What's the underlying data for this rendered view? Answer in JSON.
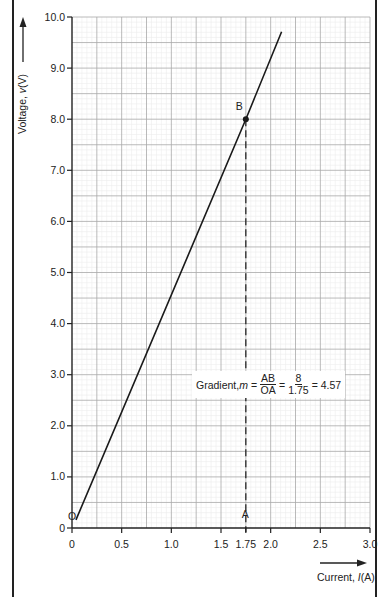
{
  "chart_data": {
    "type": "line",
    "title": "",
    "xlabel": "Current, I(A)",
    "ylabel": "Voltage, v(V)",
    "xlim": [
      0,
      3.0
    ],
    "ylim": [
      0,
      10.0
    ],
    "grid": true,
    "x_ticks": [
      "0",
      "0.5",
      "1.0",
      "1.5",
      "1.75",
      "2.0",
      "2.5",
      "3.0"
    ],
    "x_tick_values": [
      0,
      0.5,
      1.0,
      1.5,
      1.75,
      2.0,
      2.5,
      3.0
    ],
    "y_ticks": [
      "0",
      "1.0",
      "2.0",
      "3.0",
      "4.0",
      "5.0",
      "6.0",
      "7.0",
      "8.0",
      "9.0",
      "10.0"
    ],
    "y_tick_values": [
      0,
      1,
      2,
      3,
      4,
      5,
      6,
      7,
      8,
      9,
      10
    ],
    "series": [
      {
        "name": "V-I line",
        "x": [
          0.04,
          1.75,
          2.11
        ],
        "y": [
          0.16,
          8.0,
          9.71
        ]
      }
    ],
    "points": [
      {
        "label": "O",
        "x": 0,
        "y": 0
      },
      {
        "label": "A",
        "x": 1.75,
        "y": 0
      },
      {
        "label": "B",
        "x": 1.75,
        "y": 8.0
      }
    ],
    "annotations": [
      {
        "text": "Gradient, m = AB/OA = 8/1.75 = 4.57",
        "prefix": "Gradient, ",
        "var": "m",
        "eq1": "=",
        "frac1_num": "AB",
        "frac1_den": "OA",
        "eq2": "=",
        "frac2_num": "8",
        "frac2_den": "1.75",
        "result": "= 4.57"
      }
    ],
    "legend": null
  },
  "labels": {
    "ylabel_text": "Voltage, ",
    "ylabel_var": "v",
    "ylabel_unit": "(V)",
    "xlabel_text": "Current, ",
    "xlabel_var": "I",
    "xlabel_unit": "(A)",
    "point_O": "O",
    "point_A": "A",
    "point_B": "B"
  }
}
